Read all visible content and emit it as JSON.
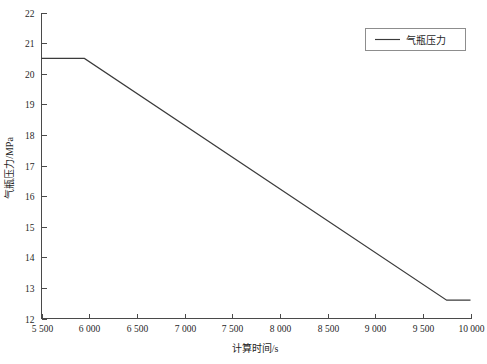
{
  "chart_data": {
    "type": "line",
    "title": "",
    "xlabel": "计算时间/s",
    "ylabel": "气瓶压力/MPa",
    "xlim": [
      5500,
      10000
    ],
    "ylim": [
      12,
      22
    ],
    "grid": false,
    "legend_position": "top-right",
    "x_tick_values": [
      5500,
      6000,
      6500,
      7000,
      7500,
      8000,
      8500,
      9000,
      9500,
      10000
    ],
    "x_tick_labels": [
      "5 500",
      "6 000",
      "6 500",
      "7 000",
      "7 500",
      "8 000",
      "8 500",
      "9 000",
      "9 500",
      "10 000"
    ],
    "y_tick_values": [
      12,
      13,
      14,
      15,
      16,
      17,
      18,
      19,
      20,
      21,
      22
    ],
    "y_tick_labels": [
      "12",
      "13",
      "14",
      "15",
      "16",
      "17",
      "18",
      "19",
      "20",
      "21",
      "22"
    ],
    "series": [
      {
        "name": "气瓶压力",
        "color": "#3b3b3b",
        "x": [
          5500,
          5950,
          9750,
          10000
        ],
        "values": [
          20.5,
          20.5,
          12.6,
          12.6
        ]
      }
    ]
  },
  "legend": {
    "entries": [
      {
        "label": "气瓶压力"
      }
    ]
  },
  "axes": {
    "x_title": "计算时间/s",
    "y_title": "气瓶压力/MPa"
  }
}
